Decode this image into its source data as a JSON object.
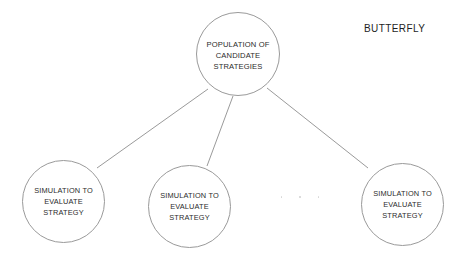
{
  "diagram": {
    "title": "BUTTERFLY",
    "background_color": "#ffffff",
    "stroke_color": "#9a9a9a",
    "text_color": "#2b2b2b",
    "type": "tree",
    "nodes": [
      {
        "id": "root",
        "shape": "circle",
        "label": "POPULATION OF\nCANDIDATE\nSTRATEGIES",
        "cx": 238,
        "cy": 54,
        "r": 42
      },
      {
        "id": "sim-1",
        "shape": "circle",
        "label": "SIMULATION TO\nEVALUATE\nSTRATEGY",
        "cx": 63,
        "cy": 201,
        "r": 41
      },
      {
        "id": "sim-2",
        "shape": "circle",
        "label": "SIMULATION TO\nEVALUATE\nSTRATEGY",
        "cx": 189,
        "cy": 206,
        "r": 41
      },
      {
        "id": "sim-3",
        "shape": "circle",
        "label": "SIMULATION TO\nEVALUATE\nSTRATEGY",
        "cx": 402,
        "cy": 204,
        "r": 41
      }
    ],
    "edges": [
      {
        "from": "root",
        "to": "sim-1",
        "x1": 208,
        "y1": 89,
        "x2": 97,
        "y2": 168
      },
      {
        "from": "root",
        "to": "sim-2",
        "x1": 233,
        "y1": 96,
        "x2": 207,
        "y2": 166
      },
      {
        "from": "root",
        "to": "sim-3",
        "x1": 267,
        "y1": 88,
        "x2": 368,
        "y2": 168
      }
    ],
    "continuation_marker": {
      "label": "ellipsis",
      "dots": 3
    }
  }
}
